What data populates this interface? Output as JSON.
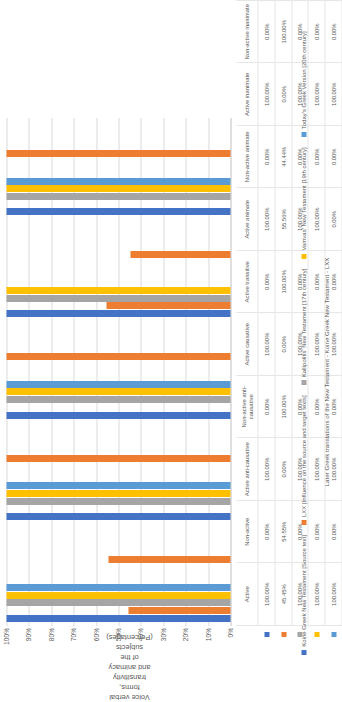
{
  "chart_data": {
    "type": "bar",
    "orientation": "vertical",
    "title": "",
    "ylabel": "Voice verbal forms, transitivity and animacy of the subjects (Percentages)",
    "xlabel": "Later Greek translations of the New Testament - Koine Greek New Testament - LXX",
    "ylim": [
      0,
      100
    ],
    "grid": true,
    "legend_position": "bottom",
    "ytick_labels": [
      "100%",
      "90%",
      "80%",
      "70%",
      "60%",
      "50%",
      "40%",
      "30%",
      "20%",
      "10%",
      "0%"
    ],
    "ytick_values": [
      100,
      90,
      80,
      70,
      60,
      50,
      40,
      30,
      20,
      10,
      0
    ],
    "categories": [
      "Active",
      "Non-active",
      "Active anti-causative",
      "Non-active anti-causative",
      "Active causative",
      "Active transitive",
      "Active animate",
      "Non-active animate",
      "Active inanimate",
      "Non-active inanimate"
    ],
    "series": [
      {
        "name": "Koine Greek New Testament [Source text]",
        "color": "#4472C4",
        "values": [
          100.0,
          0.0,
          100.0,
          0.0,
          100.0,
          0.0,
          100.0,
          0.0,
          100.0,
          0.0
        ],
        "labels": [
          "100.00%",
          "0.00%",
          "100.00%",
          "0.00%",
          "100.00%",
          "0.00%",
          "100.00%",
          "0.00%",
          "100.00%",
          "0.00%"
        ]
      },
      {
        "name": "LXX [Influence on the source and target texts]",
        "color": "#ED7D31",
        "values": [
          45.45,
          54.55,
          0.0,
          100.0,
          0.0,
          100.0,
          55.56,
          44.44,
          0.0,
          100.0
        ],
        "labels": [
          "45.45%",
          "54.55%",
          "0.00%",
          "100.00%",
          "0.00%",
          "100.00%",
          "55.56%",
          "44.44%",
          "0.00%",
          "100.00%"
        ]
      },
      {
        "name": "Kallipolitis' New Testament [17th century]",
        "color": "#A5A5A5",
        "values": [
          100.0,
          0.0,
          100.0,
          0.0,
          100.0,
          0.0,
          100.0,
          0.0,
          100.0,
          0.0
        ],
        "labels": [
          "100.00%",
          "0.00%",
          "100.00%",
          "0.00%",
          "100.00%",
          "0.00%",
          "100.00%",
          "0.00%",
          "100.00%",
          "0.00%"
        ]
      },
      {
        "name": "Vamvas' New Testament [19th century]",
        "color": "#FFC000",
        "values": [
          100.0,
          0.0,
          100.0,
          0.0,
          100.0,
          0.0,
          100.0,
          0.0,
          100.0,
          0.0
        ],
        "labels": [
          "100.00%",
          "0.00%",
          "100.00%",
          "0.00%",
          "100.00%",
          "0.00%",
          "100.00%",
          "0.00%",
          "100.00%",
          "0.00%"
        ]
      },
      {
        "name": "Today's Greek Version [20th century]",
        "color": "#5B9BD5",
        "values": [
          100.0,
          0.0,
          100.0,
          0.0,
          100.0,
          0.0,
          0.0,
          0.0,
          100.0,
          0.0
        ],
        "labels": [
          "100.00%",
          "0.00%",
          "100.00%",
          "0.00%",
          "100.00%",
          "0.00%",
          "0.00%",
          "0.00%",
          "100.00%",
          "0.00%"
        ]
      }
    ],
    "table": {
      "column_headers": [
        "Active",
        "Non-active",
        "Active anti-causative",
        "Non-active anti-causative",
        "Active causative",
        "Active transitive",
        "Active animate",
        "Non-active animate",
        "Active inanimate",
        "Non-active inanimate"
      ],
      "rows": [
        {
          "label": "",
          "color": "#4472C4",
          "values": [
            "100.00%",
            "0.00%",
            "100.00%",
            "0.00%",
            "100.00%",
            "0.00%",
            "100.00%",
            "0.00%",
            "100.00%",
            "0.00%"
          ]
        },
        {
          "label": "",
          "color": "#ED7D31",
          "values": [
            "45.45%",
            "54.55%",
            "0.00%",
            "100.00%",
            "0.00%",
            "100.00%",
            "55.56%",
            "44.44%",
            "0.00%",
            "100.00%"
          ]
        },
        {
          "label": "",
          "color": "#A5A5A5",
          "values": [
            "100.00%",
            "0.00%",
            "100.00%",
            "0.00%",
            "100.00%",
            "0.00%",
            "100.00%",
            "0.00%",
            "100.00%",
            "0.00%"
          ]
        },
        {
          "label": "",
          "color": "#FFC000",
          "values": [
            "100.00%",
            "0.00%",
            "100.00%",
            "0.00%",
            "100.00%",
            "0.00%",
            "100.00%",
            "0.00%",
            "100.00%",
            "0.00%"
          ]
        },
        {
          "label": "",
          "color": "#5B9BD5",
          "values": [
            "100.00%",
            "0.00%",
            "100.00%",
            "0.00%",
            "100.00%",
            "0.00%",
            "0.00%",
            "0.00%",
            "100.00%",
            "0.00%"
          ]
        }
      ]
    }
  }
}
